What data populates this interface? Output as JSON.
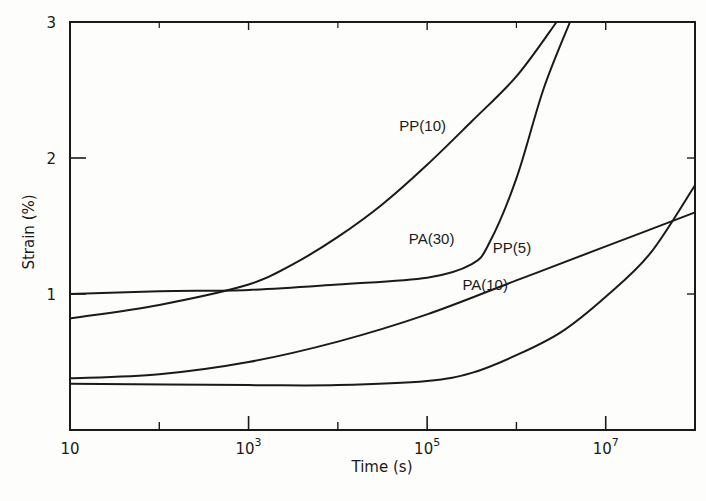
{
  "chart_data": {
    "type": "line",
    "title": "",
    "xlabel": "Time (s)",
    "ylabel": "Strain (%)",
    "xscale": "log",
    "xlim": [
      10,
      100000000
    ],
    "ylim": [
      0,
      3
    ],
    "x_major_ticks": [
      {
        "value": 10,
        "label": "10",
        "base": "10",
        "exp": ""
      },
      {
        "value": 1000,
        "label": "10^3",
        "base": "10",
        "exp": "3"
      },
      {
        "value": 100000,
        "label": "10^5",
        "base": "10",
        "exp": "5"
      },
      {
        "value": 10000000,
        "label": "10^7",
        "base": "10",
        "exp": "7"
      }
    ],
    "x_minor_ticks": [
      100,
      10000,
      1000000
    ],
    "y_ticks": [
      {
        "value": 1,
        "label": "1"
      },
      {
        "value": 2,
        "label": "2"
      },
      {
        "value": 3,
        "label": "3"
      }
    ],
    "grid": false,
    "legend": "inline curve labels",
    "series": [
      {
        "name": "PP(10)",
        "label_pos": {
          "log_t": 4.95,
          "strain": 2.2
        },
        "log_t": [
          1,
          2,
          3,
          3.5,
          4,
          4.5,
          5,
          5.5,
          6,
          6.45
        ],
        "strain": [
          0.82,
          0.92,
          1.07,
          1.22,
          1.42,
          1.66,
          1.95,
          2.27,
          2.6,
          3.0
        ]
      },
      {
        "name": "PA(30)",
        "label_pos": {
          "log_t": 5.05,
          "strain": 1.37
        },
        "log_t": [
          1,
          2,
          3,
          4,
          5,
          5.5,
          5.7,
          6.0,
          6.3,
          6.6
        ],
        "strain": [
          1.0,
          1.02,
          1.03,
          1.07,
          1.12,
          1.22,
          1.38,
          1.85,
          2.5,
          3.0
        ]
      },
      {
        "name": "PP(5)",
        "label_pos": {
          "log_t": 5.95,
          "strain": 1.3
        },
        "log_t": [
          1,
          2,
          3,
          4,
          5,
          6,
          7,
          8
        ],
        "strain": [
          0.38,
          0.41,
          0.5,
          0.65,
          0.85,
          1.1,
          1.35,
          1.6
        ]
      },
      {
        "name": "PA(10)",
        "label_pos": {
          "log_t": 5.65,
          "strain": 1.03
        },
        "log_t": [
          1,
          3,
          4,
          5,
          5.5,
          6,
          6.5,
          7,
          7.5,
          8
        ],
        "strain": [
          0.34,
          0.33,
          0.33,
          0.36,
          0.42,
          0.55,
          0.72,
          0.98,
          1.3,
          1.8
        ]
      }
    ]
  },
  "axes": {
    "xlabel": "Time  (s)",
    "ylabel": "Strain  (%)"
  }
}
